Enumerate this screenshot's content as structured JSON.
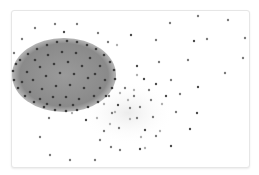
{
  "graph": {
    "type": "network",
    "layout": "force-directed",
    "colors": {
      "cluster_fill": "#8f8f8f",
      "cluster_edge": "#a8a8a8",
      "halo": "#eeeeee",
      "node_dark": "#4a4a4a",
      "node_mid": "#7a7a7a",
      "node_light": "#b0b0b0"
    },
    "cluster": {
      "cx": 64,
      "cy": 75,
      "rx": 52,
      "ry": 37
    },
    "halo": {
      "cx": 128,
      "cy": 113,
      "rx": 46,
      "ry": 32
    },
    "nodes": [
      [
        55,
        24,
        "m"
      ],
      [
        77,
        24,
        "m"
      ],
      [
        35,
        28,
        "m"
      ],
      [
        64,
        32,
        "d"
      ],
      [
        98,
        33,
        "m"
      ],
      [
        22,
        39,
        "m"
      ],
      [
        108,
        42,
        "m"
      ],
      [
        117,
        45,
        "l"
      ],
      [
        14,
        53,
        "m"
      ],
      [
        131,
        35,
        "d"
      ],
      [
        170,
        23,
        "m"
      ],
      [
        198,
        16,
        "m"
      ],
      [
        228,
        20,
        "m"
      ],
      [
        156,
        40,
        "m"
      ],
      [
        194,
        41,
        "d"
      ],
      [
        207,
        39,
        "m"
      ],
      [
        245,
        38,
        "m"
      ],
      [
        159,
        62,
        "m"
      ],
      [
        188,
        60,
        "m"
      ],
      [
        243,
        58,
        "m"
      ],
      [
        137,
        66,
        "d"
      ],
      [
        137,
        75,
        "l"
      ],
      [
        144,
        79,
        "d"
      ],
      [
        156,
        84,
        "d"
      ],
      [
        198,
        87,
        "d"
      ],
      [
        171,
        80,
        "m"
      ],
      [
        225,
        73,
        "m"
      ],
      [
        180,
        94,
        "m"
      ],
      [
        166,
        96,
        "d"
      ],
      [
        197,
        113,
        "d"
      ],
      [
        190,
        129,
        "d"
      ],
      [
        171,
        146,
        "d"
      ],
      [
        137,
        118,
        "m"
      ],
      [
        140,
        107,
        "m"
      ],
      [
        153,
        117,
        "m"
      ],
      [
        145,
        130,
        "d"
      ],
      [
        140,
        149,
        "d"
      ],
      [
        130,
        119,
        "l"
      ],
      [
        119,
        128,
        "m"
      ],
      [
        104,
        131,
        "m"
      ],
      [
        100,
        140,
        "m"
      ],
      [
        111,
        147,
        "m"
      ],
      [
        120,
        150,
        "m"
      ],
      [
        145,
        148,
        "l"
      ],
      [
        128,
        100,
        "l"
      ],
      [
        130,
        108,
        "m"
      ],
      [
        115,
        112,
        "l"
      ],
      [
        97,
        118,
        "l"
      ],
      [
        86,
        120,
        "d"
      ],
      [
        49,
        118,
        "m"
      ],
      [
        40,
        137,
        "m"
      ],
      [
        72,
        113,
        "l"
      ],
      [
        50,
        155,
        "m"
      ],
      [
        70,
        160,
        "m"
      ],
      [
        95,
        160,
        "m"
      ],
      [
        118,
        105,
        "d"
      ],
      [
        109,
        96,
        "m"
      ],
      [
        120,
        93,
        "l"
      ],
      [
        134,
        96,
        "m"
      ],
      [
        151,
        100,
        "m"
      ],
      [
        162,
        104,
        "l"
      ],
      [
        134,
        90,
        "l"
      ],
      [
        125,
        88,
        "m"
      ],
      [
        149,
        90,
        "m"
      ],
      [
        112,
        113,
        "m"
      ],
      [
        104,
        104,
        "l"
      ],
      [
        160,
        131,
        "l"
      ],
      [
        156,
        136,
        "m"
      ],
      [
        176,
        112,
        "m"
      ],
      [
        141,
        137,
        "l"
      ],
      [
        110,
        124,
        "l"
      ]
    ],
    "cluster_nodes": [
      [
        20,
        60
      ],
      [
        28,
        54
      ],
      [
        37,
        49
      ],
      [
        47,
        45
      ],
      [
        57,
        42
      ],
      [
        67,
        41
      ],
      [
        77,
        42
      ],
      [
        87,
        45
      ],
      [
        96,
        49
      ],
      [
        104,
        55
      ],
      [
        110,
        62
      ],
      [
        114,
        70
      ],
      [
        115,
        79
      ],
      [
        112,
        88
      ],
      [
        106,
        96
      ],
      [
        98,
        102
      ],
      [
        88,
        107
      ],
      [
        77,
        110
      ],
      [
        66,
        111
      ],
      [
        55,
        110
      ],
      [
        44,
        107
      ],
      [
        34,
        102
      ],
      [
        25,
        96
      ],
      [
        18,
        88
      ],
      [
        14,
        80
      ],
      [
        13,
        71
      ],
      [
        16,
        64
      ],
      [
        35,
        60
      ],
      [
        48,
        55
      ],
      [
        62,
        52
      ],
      [
        76,
        53
      ],
      [
        90,
        58
      ],
      [
        100,
        66
      ],
      [
        27,
        72
      ],
      [
        40,
        67
      ],
      [
        54,
        64
      ],
      [
        68,
        62
      ],
      [
        82,
        66
      ],
      [
        95,
        74
      ],
      [
        105,
        80
      ],
      [
        22,
        82
      ],
      [
        33,
        80
      ],
      [
        46,
        76
      ],
      [
        60,
        73
      ],
      [
        74,
        74
      ],
      [
        88,
        78
      ],
      [
        100,
        88
      ],
      [
        30,
        92
      ],
      [
        42,
        89
      ],
      [
        56,
        86
      ],
      [
        70,
        85
      ],
      [
        84,
        88
      ],
      [
        94,
        96
      ],
      [
        40,
        99
      ],
      [
        53,
        97
      ],
      [
        66,
        97
      ],
      [
        79,
        99
      ],
      [
        60,
        105
      ],
      [
        73,
        105
      ],
      [
        47,
        104
      ]
    ]
  }
}
